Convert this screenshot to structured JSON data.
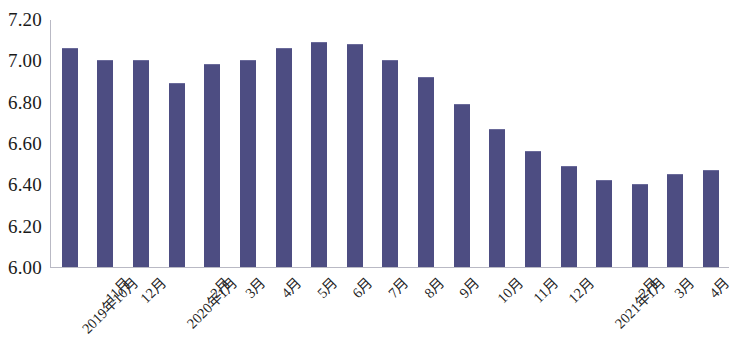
{
  "chart_data": {
    "type": "bar",
    "title": "",
    "subtitle": "",
    "xlabel": "",
    "ylabel": "",
    "ylim": [
      6.0,
      7.2
    ],
    "ytick_step": 0.2,
    "grid": false,
    "legend": null,
    "bar_color": "#4d4d82",
    "axis_color": "#b9b9c4",
    "yticks": [
      "7.20",
      "7.00",
      "6.80",
      "6.60",
      "6.40",
      "6.20",
      "6.00"
    ],
    "ytick_values": [
      7.2,
      7.0,
      6.8,
      6.6,
      6.4,
      6.2,
      6.0
    ],
    "categories": [
      "2019年10月",
      "11月",
      "12月",
      "2020年1月",
      "2月",
      "3月",
      "4月",
      "5月",
      "6月",
      "7月",
      "8月",
      "9月",
      "10月",
      "11月",
      "12月",
      "2021年1月",
      "2月",
      "3月",
      "4月"
    ],
    "values": [
      7.06,
      7.0,
      7.0,
      6.89,
      6.98,
      7.0,
      7.06,
      7.09,
      7.08,
      7.0,
      6.92,
      6.79,
      6.67,
      6.56,
      6.49,
      6.42,
      6.4,
      6.45,
      6.47
    ]
  }
}
